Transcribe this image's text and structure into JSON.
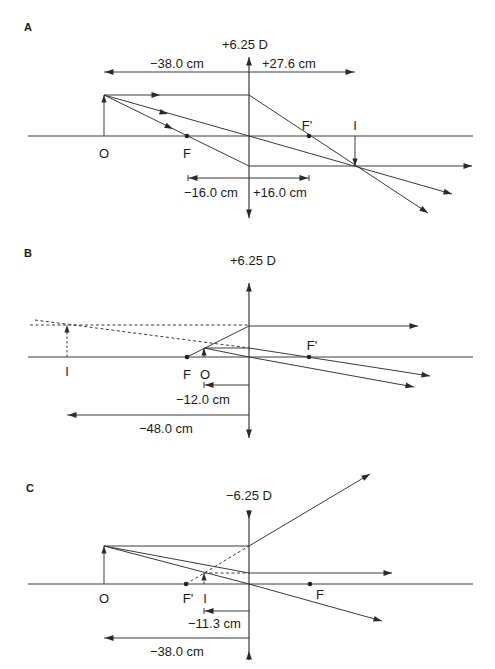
{
  "colors": {
    "line": "#3a3a3a",
    "text": "#1a1a1a",
    "background": "#ffffff"
  },
  "panels": [
    {
      "id": "A",
      "label": "A",
      "label_pos": [
        24,
        31
      ],
      "power": "+6.25 D",
      "power_pos": [
        222,
        49
      ],
      "lens_type": "converging",
      "lens": {
        "x": 249,
        "y1": 57,
        "y2": 218
      },
      "axis": {
        "y": 136,
        "x1": 28,
        "x2": 473
      },
      "points": [
        {
          "name": "O",
          "label": "O",
          "x": 104,
          "dot": false,
          "label_x": 104,
          "label_y": 158
        },
        {
          "name": "F",
          "label": "F",
          "x": 187,
          "dot": true,
          "label_x": 187,
          "label_y": 158
        },
        {
          "name": "F-prime",
          "label": "F'",
          "x": 309,
          "dot": true,
          "label_x": 307,
          "label_y": 130
        },
        {
          "name": "I",
          "label": "I",
          "x": 355,
          "dot": false,
          "label_x": 355,
          "label_y": 130
        }
      ],
      "arrows_obj": [
        {
          "name": "object-arrow",
          "x": 104,
          "y1": 136,
          "y2": 95,
          "dashed": false
        },
        {
          "name": "image-arrow",
          "x": 355,
          "y1": 136,
          "y2": 166,
          "dashed": false
        }
      ],
      "rays": [
        {
          "pts": [
            [
              104,
              95
            ],
            [
              249,
              95
            ],
            [
              428,
              213
            ]
          ],
          "arrow_end": true,
          "mid_arrow": [
            160,
            95
          ],
          "dashed": false
        },
        {
          "pts": [
            [
              104,
              95
            ],
            [
              249,
              136
            ],
            [
              452,
              194
            ]
          ],
          "arrow_end": true,
          "mid_arrow": [
            168,
            114
          ],
          "dashed": false
        },
        {
          "pts": [
            [
              104,
              95
            ],
            [
              249,
              166
            ],
            [
              472,
              166
            ]
          ],
          "arrow_end": true,
          "mid_arrow": [
            173,
            129
          ],
          "dashed": false
        }
      ],
      "dims": [
        {
          "label": "−38.0 cm",
          "y": 72,
          "x_from": 249,
          "x_to": 104,
          "label_x": 150,
          "label_y": 68,
          "tick": false
        },
        {
          "label": "+27.6 cm",
          "y": 72,
          "x_from": 249,
          "x_to": 355,
          "label_x": 262,
          "label_y": 68,
          "tick": false
        },
        {
          "label": "−16.0 cm",
          "y": 178,
          "x_from": 249,
          "x_to": 188,
          "label_x": 184,
          "label_y": 197,
          "tick": true
        },
        {
          "label": "+16.0 cm",
          "y": 178,
          "x_from": 249,
          "x_to": 309,
          "label_x": 253,
          "label_y": 197,
          "tick": true
        }
      ]
    },
    {
      "id": "B",
      "label": "B",
      "label_pos": [
        24,
        257
      ],
      "power": "+6.25 D",
      "power_pos": [
        230,
        265
      ],
      "lens_type": "converging",
      "lens": {
        "x": 249,
        "y1": 283,
        "y2": 438
      },
      "axis": {
        "y": 357,
        "x1": 28,
        "x2": 473
      },
      "points": [
        {
          "name": "I",
          "label": "I",
          "x": 67,
          "dot": false,
          "label_x": 67,
          "label_y": 376
        },
        {
          "name": "F",
          "label": "F",
          "x": 187,
          "dot": true,
          "label_x": 187,
          "label_y": 379
        },
        {
          "name": "O",
          "label": "O",
          "x": 204,
          "dot": false,
          "label_x": 205,
          "label_y": 379
        },
        {
          "name": "F-prime",
          "label": "F'",
          "x": 309,
          "dot": true,
          "label_x": 312,
          "label_y": 350
        }
      ],
      "arrows_obj": [
        {
          "name": "object-arrow",
          "x": 204,
          "y1": 357,
          "y2": 348,
          "dashed": false
        },
        {
          "name": "image-arrow",
          "x": 67,
          "y1": 357,
          "y2": 325,
          "dashed": true
        }
      ],
      "rays": [
        {
          "pts": [
            [
              187,
              357
            ],
            [
              249,
              326
            ],
            [
              418,
              326
            ]
          ],
          "arrow_end": true,
          "dashed": false
        },
        {
          "pts": [
            [
              204,
              348
            ],
            [
              249,
              348
            ],
            [
              430,
              376
            ]
          ],
          "arrow_end": true,
          "dashed": false
        },
        {
          "pts": [
            [
              204,
              348
            ],
            [
              249,
              357
            ],
            [
              414,
              387
            ]
          ],
          "arrow_end": true,
          "dashed": false
        },
        {
          "pts": [
            [
              30,
              325
            ],
            [
              249,
              325
            ]
          ],
          "arrow_end": false,
          "dashed": true
        },
        {
          "pts": [
            [
              35,
              320
            ],
            [
              249,
              348
            ]
          ],
          "arrow_end": false,
          "dashed": true
        }
      ],
      "dims": [
        {
          "label": "−12.0 cm",
          "y": 385,
          "x_from": 249,
          "x_to": 204,
          "label_x": 176,
          "label_y": 404,
          "tick": true
        },
        {
          "label": "−48.0 cm",
          "y": 415,
          "x_from": 249,
          "x_to": 67,
          "label_x": 139,
          "label_y": 433,
          "tick": false
        }
      ]
    },
    {
      "id": "C",
      "label": "C",
      "label_pos": [
        26,
        492
      ],
      "power": "−6.25 D",
      "power_pos": [
        226,
        500
      ],
      "lens_type": "diverging",
      "lens": {
        "x": 249,
        "y1": 510,
        "y2": 660
      },
      "axis": {
        "y": 584,
        "x1": 28,
        "x2": 473
      },
      "points": [
        {
          "name": "O",
          "label": "O",
          "x": 104,
          "dot": false,
          "label_x": 104,
          "label_y": 603
        },
        {
          "name": "F-prime",
          "label": "F'",
          "x": 186,
          "dot": true,
          "label_x": 188,
          "label_y": 603
        },
        {
          "name": "I",
          "label": "I",
          "x": 204,
          "dot": false,
          "label_x": 205,
          "label_y": 603
        },
        {
          "name": "F",
          "label": "F",
          "x": 310,
          "dot": true,
          "label_x": 320,
          "label_y": 599
        }
      ],
      "arrows_obj": [
        {
          "name": "object-arrow",
          "x": 104,
          "y1": 584,
          "y2": 546,
          "dashed": false
        },
        {
          "name": "image-arrow",
          "x": 204,
          "y1": 584,
          "y2": 573,
          "dashed": true
        }
      ],
      "rays": [
        {
          "pts": [
            [
              104,
              546
            ],
            [
              249,
              546
            ],
            [
              370,
              474
            ]
          ],
          "arrow_end": true,
          "dashed": false
        },
        {
          "pts": [
            [
              104,
              546
            ],
            [
              249,
              573
            ],
            [
              392,
              573
            ]
          ],
          "arrow_end": true,
          "dashed": false
        },
        {
          "pts": [
            [
              104,
              546
            ],
            [
              249,
              584
            ],
            [
              382,
              621
            ]
          ],
          "arrow_end": true,
          "dashed": false
        },
        {
          "pts": [
            [
              186,
              584
            ],
            [
              249,
              546
            ]
          ],
          "arrow_end": false,
          "dashed": true
        },
        {
          "pts": [
            [
              204,
              573
            ],
            [
              249,
              573
            ]
          ],
          "arrow_end": false,
          "dashed": true
        }
      ],
      "dims": [
        {
          "label": "−11.3 cm",
          "y": 611,
          "x_from": 249,
          "x_to": 204,
          "label_x": 188,
          "label_y": 628,
          "tick": true
        },
        {
          "label": "−38.0 cm",
          "y": 638,
          "x_from": 249,
          "x_to": 104,
          "label_x": 150,
          "label_y": 656,
          "tick": false
        }
      ]
    }
  ]
}
